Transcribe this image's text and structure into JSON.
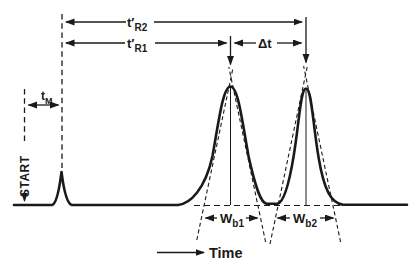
{
  "diagram": {
    "type": "chromatogram-retention-time-schematic",
    "colors": {
      "background": "#ffffff",
      "ink": "#1a1a1a"
    },
    "labels": {
      "t_r2": {
        "base": "t′",
        "sub": "R2"
      },
      "t_r1": {
        "base": "t′",
        "sub": "R1"
      },
      "delta_t": "Δt",
      "t_m": {
        "base": "t",
        "sub": "M"
      },
      "w_b1": {
        "base": "W",
        "sub": "b1"
      },
      "w_b2": {
        "base": "W",
        "sub": "b2"
      },
      "start": "START",
      "time_axis": "Time"
    }
  }
}
